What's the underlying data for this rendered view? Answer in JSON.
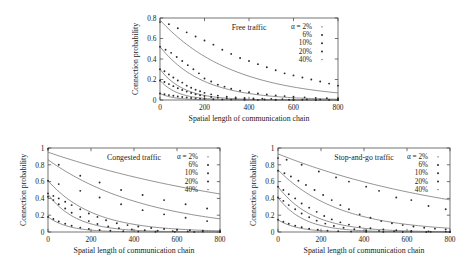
{
  "figure": {
    "panels_count": 3
  },
  "axis": {
    "xlabel": "Spatial length of communication chain",
    "ylabel": "Connection probability"
  },
  "legend": {
    "alpha_prefix": "α = 2%",
    "entries": [
      "α = 2%",
      "6%",
      "10%",
      "20%",
      "40%"
    ],
    "labels_rest": [
      "6%",
      "10%",
      "20%",
      "40%"
    ]
  },
  "chart_data": [
    {
      "type": "scatter",
      "title": "Free traffic",
      "xlabel": "Spatial length of communication chain",
      "ylabel": "Connection probability",
      "xlim": [
        0,
        800
      ],
      "ylim": [
        0,
        0.8
      ],
      "xticks": [
        0,
        200,
        400,
        600,
        800
      ],
      "yticks": [
        0,
        0.2,
        0.4,
        0.6,
        0.8
      ],
      "ytick_labels": [
        "0",
        "0.2",
        "0.4",
        "0.6",
        "0.8"
      ],
      "grid": false,
      "legend_position": "top-right",
      "series": [
        {
          "name": "α = 2%",
          "fit_start": 0.78,
          "fit_decay_length": 330,
          "x": [
            0,
            40,
            80,
            120,
            160,
            200,
            240,
            280,
            320,
            360,
            400,
            440,
            480,
            520,
            560,
            600,
            640,
            680,
            720,
            760,
            800
          ],
          "y": [
            0.76,
            0.74,
            0.7,
            0.66,
            0.62,
            0.58,
            0.54,
            0.49,
            0.45,
            0.41,
            0.38,
            0.35,
            0.32,
            0.29,
            0.26,
            0.24,
            0.22,
            0.2,
            0.18,
            0.16,
            0.14
          ]
        },
        {
          "name": "6%",
          "fit_start": 0.52,
          "fit_decay_length": 190,
          "x": [
            0,
            25,
            50,
            75,
            100,
            125,
            150,
            175,
            200,
            230,
            260,
            290,
            320,
            360,
            400,
            440,
            480,
            520,
            560,
            600,
            650,
            700,
            750,
            800
          ],
          "y": [
            0.52,
            0.49,
            0.46,
            0.42,
            0.38,
            0.34,
            0.3,
            0.26,
            0.21,
            0.18,
            0.15,
            0.13,
            0.11,
            0.09,
            0.075,
            0.063,
            0.053,
            0.045,
            0.038,
            0.032,
            0.026,
            0.021,
            0.017,
            0.014
          ]
        },
        {
          "name": "10%",
          "fit_start": 0.3,
          "fit_decay_length": 105,
          "x": [
            0,
            20,
            40,
            60,
            80,
            100,
            120,
            140,
            160,
            180,
            200,
            230,
            260,
            300,
            340,
            380,
            420,
            460,
            500,
            550,
            600,
            660,
            720,
            800
          ],
          "y": [
            0.3,
            0.28,
            0.25,
            0.22,
            0.19,
            0.17,
            0.14,
            0.12,
            0.1,
            0.085,
            0.07,
            0.055,
            0.043,
            0.032,
            0.025,
            0.02,
            0.016,
            0.013,
            0.011,
            0.009,
            0.007,
            0.006,
            0.005,
            0.004
          ]
        },
        {
          "name": "20%",
          "fit_start": 0.19,
          "fit_decay_length": 80,
          "x": [
            0,
            20,
            40,
            60,
            80,
            100,
            120,
            140,
            160,
            180,
            200,
            230,
            260,
            300,
            340,
            380,
            420,
            470,
            520,
            580,
            640,
            700,
            760,
            800
          ],
          "y": [
            0.19,
            0.175,
            0.155,
            0.135,
            0.115,
            0.098,
            0.082,
            0.068,
            0.056,
            0.046,
            0.038,
            0.029,
            0.022,
            0.016,
            0.012,
            0.009,
            0.007,
            0.005,
            0.004,
            0.003,
            0.002,
            0.002,
            0.001,
            0.001
          ]
        },
        {
          "name": "40%",
          "fit_start": 0.063,
          "fit_decay_length": 62,
          "x": [
            0,
            20,
            40,
            60,
            80,
            100,
            120,
            140,
            160,
            180,
            200,
            240,
            280,
            320,
            380,
            440,
            520,
            600,
            700,
            800
          ],
          "y": [
            0.063,
            0.056,
            0.048,
            0.041,
            0.034,
            0.029,
            0.024,
            0.02,
            0.016,
            0.013,
            0.011,
            0.008,
            0.005,
            0.004,
            0.002,
            0.001,
            0.001,
            0.0005,
            0.0003,
            0.0002
          ]
        }
      ]
    },
    {
      "type": "scatter",
      "title": "Congested traffic",
      "xlabel": "Spatial length of communication chain",
      "ylabel": "Connection probability",
      "xlim": [
        0,
        800
      ],
      "ylim": [
        0,
        1
      ],
      "xticks": [
        0,
        200,
        400,
        600,
        800
      ],
      "yticks": [
        0,
        0.2,
        0.4,
        0.6,
        0.8,
        1
      ],
      "ytick_labels": [
        "0",
        "0.2",
        "0.4",
        "0.6",
        "0.8",
        "1"
      ],
      "grid": false,
      "legend_position": "top-right",
      "series": [
        {
          "name": "α = 2%",
          "fit_start": 0.95,
          "fit_decay_length": 1080,
          "x": [
            0,
            50,
            150,
            240,
            340,
            440,
            540,
            640,
            740
          ],
          "y": [
            0.99,
            0.8,
            0.67,
            0.59,
            0.5,
            0.44,
            0.38,
            0.33,
            0.28
          ]
        },
        {
          "name": "6%",
          "fit_start": 0.86,
          "fit_decay_length": 470,
          "x": [
            0,
            50,
            150,
            240,
            340,
            440,
            540,
            640,
            740
          ],
          "y": [
            0.61,
            0.57,
            0.49,
            0.41,
            0.33,
            0.26,
            0.21,
            0.17,
            0.13
          ]
        },
        {
          "name": "10%",
          "fit_start": 0.61,
          "fit_decay_length": 210,
          "x": [
            0,
            25,
            50,
            80,
            110,
            150,
            190,
            230,
            270,
            320,
            370,
            420,
            480,
            540,
            600,
            660,
            720,
            800
          ],
          "y": [
            0.46,
            0.43,
            0.4,
            0.36,
            0.32,
            0.27,
            0.22,
            0.18,
            0.14,
            0.105,
            0.082,
            0.065,
            0.048,
            0.036,
            0.027,
            0.021,
            0.016,
            0.012
          ]
        },
        {
          "name": "20%",
          "fit_start": 0.45,
          "fit_decay_length": 130,
          "x": [
            0,
            25,
            50,
            80,
            110,
            150,
            190,
            230,
            280,
            330,
            390,
            450,
            510,
            580,
            650,
            720,
            800
          ],
          "y": [
            0.42,
            0.38,
            0.33,
            0.28,
            0.23,
            0.18,
            0.13,
            0.095,
            0.065,
            0.045,
            0.03,
            0.021,
            0.015,
            0.01,
            0.007,
            0.005,
            0.003
          ]
        },
        {
          "name": "40%",
          "fit_start": 0.18,
          "fit_decay_length": 95,
          "x": [
            0,
            25,
            50,
            80,
            110,
            150,
            190,
            240,
            290,
            350,
            420,
            500,
            590,
            680,
            800
          ],
          "y": [
            0.18,
            0.155,
            0.125,
            0.098,
            0.075,
            0.052,
            0.036,
            0.023,
            0.015,
            0.009,
            0.005,
            0.003,
            0.002,
            0.001,
            0.0005
          ]
        }
      ]
    },
    {
      "type": "scatter",
      "title": "Stop-and-go traffic",
      "xlabel": "Spatial length of communication chain",
      "ylabel": "Connection probability",
      "xlim": [
        0,
        800
      ],
      "ylim": [
        0,
        1
      ],
      "xticks": [
        0,
        200,
        400,
        600,
        800
      ],
      "yticks": [
        0,
        0.2,
        0.4,
        0.6,
        0.8,
        1
      ],
      "ytick_labels": [
        "0",
        "0.2",
        "0.4",
        "0.6",
        "0.8",
        "1"
      ],
      "grid": false,
      "legend_position": "top-right",
      "series": [
        {
          "name": "α = 2%",
          "fit_start": 0.93,
          "fit_decay_length": 900,
          "x": [
            0,
            40,
            110,
            190,
            270,
            330,
            410,
            470,
            550,
            620,
            700,
            780
          ],
          "y": [
            0.88,
            0.86,
            0.8,
            0.72,
            0.65,
            0.6,
            0.54,
            0.49,
            0.41,
            0.38,
            0.31,
            0.27
          ]
        },
        {
          "name": "6%",
          "fit_start": 0.74,
          "fit_decay_length": 285,
          "x": [
            0,
            30,
            60,
            95,
            130,
            170,
            210,
            250,
            290,
            330,
            380,
            430,
            480,
            530,
            580,
            630,
            680,
            730,
            780
          ],
          "y": [
            0.73,
            0.7,
            0.66,
            0.61,
            0.56,
            0.5,
            0.44,
            0.38,
            0.32,
            0.27,
            0.21,
            0.17,
            0.13,
            0.105,
            0.082,
            0.065,
            0.05,
            0.04,
            0.031
          ]
        },
        {
          "name": "10%",
          "fit_start": 0.54,
          "fit_decay_length": 160,
          "x": [
            0,
            25,
            50,
            80,
            110,
            145,
            180,
            215,
            250,
            290,
            330,
            380,
            430,
            490,
            550,
            620,
            700,
            780
          ],
          "y": [
            0.54,
            0.5,
            0.45,
            0.4,
            0.34,
            0.29,
            0.24,
            0.19,
            0.15,
            0.115,
            0.088,
            0.063,
            0.045,
            0.03,
            0.02,
            0.013,
            0.008,
            0.005
          ]
        },
        {
          "name": "20%",
          "fit_start": 0.41,
          "fit_decay_length": 120,
          "x": [
            0,
            25,
            50,
            80,
            110,
            145,
            180,
            220,
            260,
            305,
            355,
            410,
            470,
            540,
            620,
            710,
            800
          ],
          "y": [
            0.41,
            0.37,
            0.32,
            0.27,
            0.22,
            0.175,
            0.135,
            0.1,
            0.072,
            0.05,
            0.033,
            0.021,
            0.013,
            0.008,
            0.004,
            0.002,
            0.001
          ]
        },
        {
          "name": "40%",
          "fit_start": 0.145,
          "fit_decay_length": 90,
          "x": [
            0,
            25,
            50,
            80,
            110,
            145,
            185,
            230,
            280,
            340,
            410,
            490,
            580,
            690,
            800
          ],
          "y": [
            0.145,
            0.122,
            0.098,
            0.075,
            0.056,
            0.039,
            0.026,
            0.016,
            0.01,
            0.005,
            0.003,
            0.001,
            0.0006,
            0.0003,
            0.0001
          ]
        }
      ]
    }
  ]
}
